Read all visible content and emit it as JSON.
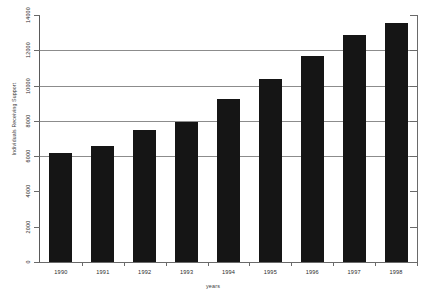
{
  "chart_data": {
    "type": "bar",
    "title": "",
    "xlabel": "years",
    "ylabel": "Individuals Receiving Support",
    "categories": [
      "1990",
      "1991",
      "1992",
      "1993",
      "1994",
      "1995",
      "1996",
      "1997",
      "1998"
    ],
    "values": [
      6150,
      6600,
      7500,
      7950,
      9250,
      10350,
      11650,
      12850,
      13550
    ],
    "ylim": [
      0,
      14000
    ],
    "yticks": [
      0,
      2000,
      4000,
      6000,
      8000,
      10000,
      12000,
      14000
    ],
    "ytick_labels": [
      "0",
      "2000",
      "4000",
      "6000",
      "8000",
      "10000",
      "12000",
      "14000"
    ],
    "grid": true,
    "gridlines_at": [
      6000,
      8000,
      10000,
      12000
    ],
    "legend": null,
    "bar_color": "#151515",
    "axis_color": "#6a6a6a",
    "grid_color": "#8c8c8c",
    "background": "#ffffff"
  }
}
